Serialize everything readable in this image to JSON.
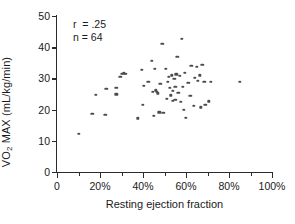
{
  "chart_data": {
    "type": "scatter",
    "title": "",
    "xlabel": "Resting ejection fraction",
    "ylabel": "VO2 MAX (mL/kg/min)",
    "ylabel_parts": {
      "v": "V",
      "o": "O",
      "sub": "2",
      "rest": " MAX (mL/kg/min)"
    },
    "xlim": [
      0,
      100
    ],
    "ylim": [
      0,
      50
    ],
    "grid": false,
    "legend": null,
    "xticks": [
      0,
      20,
      40,
      60,
      80,
      100
    ],
    "xtick_labels": [
      "0",
      "20%",
      "40%",
      "60%",
      "80%",
      "100%"
    ],
    "xticks_minor": [
      10,
      30,
      50,
      70,
      90
    ],
    "yticks": [
      0,
      10,
      20,
      30,
      40,
      50
    ],
    "ytick_labels": [
      "0",
      "10",
      "20",
      "30",
      "40",
      "50"
    ],
    "marker_color": "#4c4c4c",
    "axis_color": "#2b2b2b",
    "annotations": [
      {
        "text": "r  = .25"
      },
      {
        "text": "n = 64"
      }
    ],
    "n_points": 64,
    "correlation_r": 0.25,
    "points": [
      [
        10.0,
        12.3
      ],
      [
        16.5,
        18.6
      ],
      [
        18.0,
        24.8
      ],
      [
        22.5,
        18.4
      ],
      [
        23.0,
        26.6
      ],
      [
        27.5,
        26.9
      ],
      [
        27.5,
        24.9
      ],
      [
        29.5,
        30.6
      ],
      [
        30.0,
        31.5
      ],
      [
        31.0,
        31.6
      ],
      [
        32.0,
        31.4
      ],
      [
        37.5,
        17.2
      ],
      [
        39.5,
        32.8
      ],
      [
        40.0,
        21.6
      ],
      [
        40.5,
        27.7
      ],
      [
        42.5,
        29.0
      ],
      [
        44.0,
        35.6
      ],
      [
        44.5,
        25.6
      ],
      [
        45.0,
        17.9
      ],
      [
        45.5,
        33.0
      ],
      [
        46.0,
        26.2
      ],
      [
        46.5,
        25.6
      ],
      [
        47.0,
        25.2
      ],
      [
        47.5,
        19.1
      ],
      [
        48.0,
        28.3
      ],
      [
        49.0,
        41.0
      ],
      [
        49.5,
        19.0
      ],
      [
        50.5,
        33.1
      ],
      [
        51.0,
        23.5
      ],
      [
        51.5,
        28.9
      ],
      [
        52.0,
        30.5
      ],
      [
        52.5,
        27.0
      ],
      [
        53.0,
        24.6
      ],
      [
        53.5,
        31.0
      ],
      [
        54.0,
        22.8
      ],
      [
        54.0,
        26.0
      ],
      [
        54.5,
        29.8
      ],
      [
        55.0,
        23.2
      ],
      [
        55.0,
        27.4
      ],
      [
        55.5,
        31.3
      ],
      [
        56.0,
        36.8
      ],
      [
        56.5,
        25.4
      ],
      [
        57.0,
        30.8
      ],
      [
        57.5,
        22.4
      ],
      [
        58.0,
        42.6
      ],
      [
        58.5,
        27.2
      ],
      [
        59.0,
        19.9
      ],
      [
        59.5,
        31.8
      ],
      [
        60.0,
        17.3
      ],
      [
        61.0,
        28.6
      ],
      [
        62.0,
        24.5
      ],
      [
        62.5,
        34.0
      ],
      [
        63.5,
        21.2
      ],
      [
        64.0,
        30.2
      ],
      [
        65.0,
        33.6
      ],
      [
        65.5,
        29.3
      ],
      [
        66.5,
        31.0
      ],
      [
        67.0,
        20.7
      ],
      [
        67.5,
        34.3
      ],
      [
        68.5,
        28.9
      ],
      [
        69.0,
        21.6
      ],
      [
        70.5,
        22.6
      ],
      [
        71.5,
        28.8
      ],
      [
        85.0,
        29.0
      ]
    ]
  }
}
